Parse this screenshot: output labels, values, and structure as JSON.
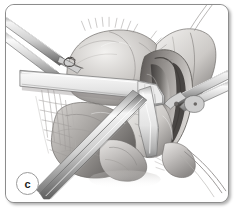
{
  "figure": {
    "panel_label": "c",
    "caption": "",
    "style": "grayscale-medical-illustration",
    "colors": {
      "background": "#ffffff",
      "border": "#8c8c8c",
      "shadow": "rgba(0,0,0,0.30)",
      "ink_dark": "#2f2f2f",
      "ink_mid": "#8a8a8a",
      "ink_light": "#d4d4d4",
      "tissue_light": "#e6e4e2",
      "tissue_mid": "#b9b6b4",
      "tissue_dark": "#6d6a68",
      "instrument_light": "#f1f1f1",
      "instrument_mid": "#c0c0c0",
      "instrument_dark": "#717171",
      "label_text": "#1c1c1c"
    }
  },
  "scene": {
    "title": "Surgical field illustration",
    "description": "Grayscale anatomical surgical illustration showing an opened operative field with retractor blades, forceps, sutures and exposed tissue planes.",
    "elements": [
      {
        "name": "forceps-upper-left",
        "label": "Forceps shafts entering from upper left"
      },
      {
        "name": "retractor-blade-horizontal",
        "label": "Broad horizontal retractor blade"
      },
      {
        "name": "retractor-blade-right",
        "label": "Right-side retractor blade"
      },
      {
        "name": "forceps-right",
        "label": "Forceps entering from right"
      },
      {
        "name": "suture-strand-lower-right",
        "label": "Suture strand exiting lower right"
      },
      {
        "name": "instrument-shaft-lower-left",
        "label": "Instrument shaft exiting lower left"
      },
      {
        "name": "tissue-mass-upper",
        "label": "Upper rounded tissue mass"
      },
      {
        "name": "tissue-cavity-right",
        "label": "Exposed cavity / bowel lumen at right"
      },
      {
        "name": "tissue-mass-lower",
        "label": "Lower tissue mass"
      },
      {
        "name": "fascial-strands",
        "label": "Fine fascial / mesenteric strands"
      },
      {
        "name": "suture-knot",
        "label": "Suture knot on upper tissue"
      }
    ]
  }
}
